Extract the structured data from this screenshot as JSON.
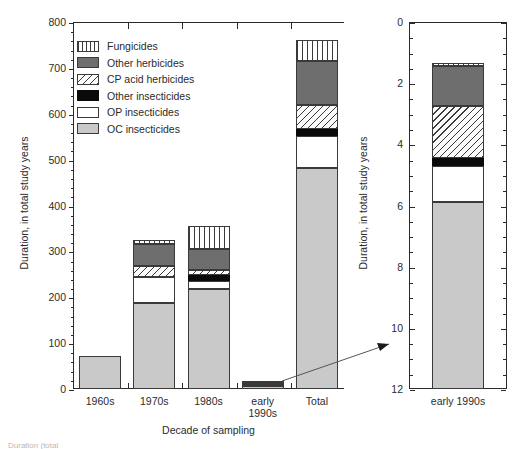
{
  "chart_data": {
    "type": "bar",
    "title": "",
    "subtitle": "",
    "stacked": true,
    "xlabel": "Decade of sampling",
    "ylabel": "Duration, in total study years",
    "grid": false,
    "legend_position": "upper-left-inside",
    "categories": [
      "1960s",
      "1970s",
      "1980s",
      "early 1990s",
      "Total"
    ],
    "ylim": [
      0,
      800
    ],
    "yticks": [
      0,
      100,
      200,
      300,
      400,
      500,
      600,
      700,
      800
    ],
    "yticklabels": [
      "0",
      "100",
      "200",
      "300",
      "400",
      "500",
      "600",
      "700",
      "800"
    ],
    "yminor_step": 20,
    "series": [
      {
        "name": "OC insecticides",
        "key": "oc",
        "color": "#c9c9c9",
        "pattern": "solid",
        "values": [
          72,
          187,
          217,
          7.2,
          482
        ]
      },
      {
        "name": "OP insecticides",
        "key": "op",
        "color": "#ffffff",
        "pattern": "solid",
        "values": [
          0,
          57,
          18,
          1.4,
          70
        ]
      },
      {
        "name": "Other insecticides",
        "key": "other-ins",
        "color": "#0a0a0a",
        "pattern": "solid",
        "values": [
          0,
          0,
          13,
          0.3,
          14
        ]
      },
      {
        "name": "CP acid herbicides",
        "key": "cp",
        "color": "#fbfbfb",
        "pattern": "diagonal-hatch",
        "values": [
          0,
          25,
          12,
          2.0,
          53
        ]
      },
      {
        "name": "Other herbicides",
        "key": "other-herb",
        "color": "#6e6e6e",
        "pattern": "solid",
        "values": [
          0,
          48,
          45,
          1.5,
          96
        ]
      },
      {
        "name": "Fungicides",
        "key": "fung",
        "color": "#ffffff",
        "pattern": "vertical-stripe",
        "values": [
          0,
          8,
          50,
          0.15,
          45
        ]
      }
    ],
    "totals": [
      72,
      325,
      355,
      10.6,
      760
    ],
    "inset": {
      "type": "bar",
      "stacked": true,
      "ylabel": "Duration, in total study years",
      "categories": [
        "early 1990s"
      ],
      "ylim": [
        0,
        12
      ],
      "yticks": [
        0,
        2,
        4,
        6,
        8,
        10,
        12
      ],
      "yticklabels": [
        "0",
        "2",
        "4",
        "6",
        "8",
        "10",
        "12"
      ],
      "yminor_step": 0.5,
      "series": [
        {
          "name": "OC insecticides",
          "key": "oc",
          "values": [
            6.1
          ]
        },
        {
          "name": "OP insecticides",
          "key": "op",
          "values": [
            1.2
          ]
        },
        {
          "name": "Other insecticides",
          "key": "other-ins",
          "values": [
            0.25
          ]
        },
        {
          "name": "CP acid herbicides",
          "key": "cp",
          "values": [
            1.7
          ]
        },
        {
          "name": "Other herbicides",
          "key": "other-herb",
          "values": [
            1.3
          ]
        },
        {
          "name": "Fungicides",
          "key": "fung",
          "values": [
            0.12
          ]
        }
      ],
      "total": 10.57,
      "annotation": "magnified view of early 1990s bar"
    }
  },
  "main": {
    "ylabel": "Duration, in total study years",
    "xlabel": "Decade of sampling",
    "yticklabels": [
      "800",
      "700",
      "600",
      "500",
      "400",
      "300",
      "200",
      "100",
      "0"
    ],
    "xticklabels": [
      "1960s",
      "1970s",
      "1980s",
      "early 1990s",
      "Total"
    ],
    "xticklabels_line1": [
      "1960s",
      "1970s",
      "1980s",
      "early",
      "Total"
    ],
    "xticklabels_line2": [
      "",
      "",
      "",
      "1990s",
      ""
    ]
  },
  "inset": {
    "ylabel": "Duration, in total study years",
    "yticklabels": [
      "12",
      "10",
      "8",
      "6",
      "4",
      "2",
      "0"
    ],
    "xticklabel": "early 1990s"
  },
  "legend": {
    "items": [
      {
        "label": "Fungicides",
        "key": "fung"
      },
      {
        "label": "Other herbicides",
        "key": "other-herb"
      },
      {
        "label": "CP acid herbicides",
        "key": "cp"
      },
      {
        "label": "Other insecticides",
        "key": "other-ins"
      },
      {
        "label": "OP insecticides",
        "key": "op"
      },
      {
        "label": "OC insecticides",
        "key": "oc"
      }
    ]
  },
  "caption": "Duration (total"
}
